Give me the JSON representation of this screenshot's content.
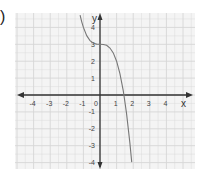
{
  "problem_label": ")",
  "chart_data": {
    "type": "line",
    "title": "",
    "xlabel": "x",
    "ylabel": "y",
    "xlim": [
      -5,
      5.4
    ],
    "ylim": [
      -4.3,
      4.9
    ],
    "grid": true,
    "x_ticks": [
      -4,
      -3,
      -2,
      -1,
      0,
      1,
      2,
      3,
      4
    ],
    "y_ticks": [
      4,
      3,
      2,
      1,
      -1,
      -2,
      -3,
      -4
    ],
    "x_tick_labels": [
      "-4",
      "-3",
      "-2",
      "-1",
      "0",
      "1",
      "2",
      "3",
      "4"
    ],
    "y_tick_labels": [
      "4",
      "3",
      "2",
      "1",
      "-1",
      "-2",
      "-3",
      "-4"
    ],
    "series": [
      {
        "name": "f(x) = -x^3 + 3",
        "x": [
          -1.2,
          -1.1,
          -1.0,
          -0.8,
          -0.6,
          -0.4,
          -0.2,
          0,
          0.2,
          0.4,
          0.6,
          0.8,
          1.0,
          1.2,
          1.4,
          1.44,
          1.6,
          1.8,
          1.91
        ],
        "y": [
          4.73,
          4.33,
          4.0,
          3.51,
          3.22,
          3.06,
          3.01,
          3.0,
          2.99,
          2.94,
          2.78,
          2.49,
          2.0,
          1.27,
          0.26,
          0.0,
          -1.1,
          -2.83,
          -3.97
        ]
      }
    ],
    "colors": {
      "grid": "#d6d6d6",
      "axis": "#333333",
      "curve": "#777777",
      "background": "#f4f4f4"
    }
  }
}
